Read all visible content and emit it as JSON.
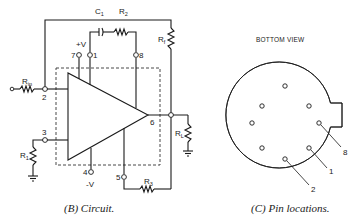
{
  "circuit": {
    "caption": "(B) Circuit.",
    "components": {
      "c1": "C",
      "c1_sub": "1",
      "r2": "R",
      "r2_sub": "2",
      "rf": "R",
      "rf_sub": "f",
      "rin": "R",
      "rin_sub": "in",
      "r1": "R",
      "r1_sub": "1",
      "rl": "R",
      "rl_sub": "L",
      "r3": "R",
      "r3_sub": "3"
    },
    "pins": {
      "p1": "1",
      "p2": "2",
      "p3": "3",
      "p4": "4",
      "p5": "5",
      "p6": "6",
      "p7": "7",
      "p8": "8"
    },
    "supplies": {
      "positive": "+V",
      "negative": "-V"
    }
  },
  "pin_locations": {
    "title": "BOTTOM VIEW",
    "caption": "(C) Pin locations.",
    "callouts": [
      "8",
      "1",
      "2"
    ]
  }
}
